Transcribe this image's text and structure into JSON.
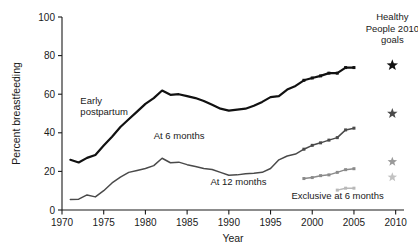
{
  "chart_data": {
    "type": "line",
    "title": "",
    "xlabel": "Year",
    "ylabel": "Percent breastfeeding",
    "xlim": [
      1970,
      2011
    ],
    "ylim": [
      0,
      100
    ],
    "xticks": [
      1970,
      1975,
      1980,
      1985,
      1990,
      1995,
      2000,
      2005,
      2010
    ],
    "yticks": [
      0,
      20,
      40,
      60,
      80,
      100
    ],
    "grid": false,
    "legend": "inline-annotations",
    "series": [
      {
        "name": "Early postpartum",
        "color": "#111111",
        "width": 2.2,
        "label_text": "Early\npostpartum",
        "label_x": 1972.2,
        "label_y": 55,
        "markers_from": 1999,
        "x": [
          1971,
          1972,
          1973,
          1974,
          1975,
          1976,
          1977,
          1978,
          1979,
          1980,
          1981,
          1982,
          1983,
          1984,
          1985,
          1986,
          1987,
          1988,
          1989,
          1990,
          1991,
          1992,
          1993,
          1994,
          1995,
          1996,
          1997,
          1998,
          1999,
          2000,
          2001,
          2002,
          2003,
          2004,
          2005
        ],
        "y": [
          26.0,
          24.6,
          27.0,
          28.5,
          33.4,
          38.0,
          43.0,
          47.0,
          51.0,
          55.0,
          58.0,
          61.9,
          59.7,
          60.0,
          59.0,
          58.0,
          56.5,
          54.5,
          52.5,
          51.5,
          52.0,
          52.5,
          54.0,
          56.0,
          58.5,
          59.0,
          62.4,
          64.3,
          67.2,
          68.4,
          69.5,
          70.9,
          70.9,
          73.8,
          73.8
        ]
      },
      {
        "name": "At 6 months",
        "color": "#4a4a4a",
        "width": 1.5,
        "label_text": "At 6 months",
        "label_x": 1981.0,
        "label_y": 37,
        "markers_from": 1999,
        "x": [
          1971,
          1972,
          1973,
          1974,
          1975,
          1976,
          1977,
          1978,
          1979,
          1980,
          1981,
          1982,
          1983,
          1984,
          1985,
          1986,
          1987,
          1988,
          1989,
          1990,
          1991,
          1992,
          1993,
          1994,
          1995,
          1996,
          1997,
          1998,
          1999,
          2000,
          2001,
          2002,
          2003,
          2004,
          2005
        ],
        "y": [
          5.5,
          5.6,
          7.8,
          6.8,
          10.0,
          14.0,
          17.0,
          19.5,
          20.5,
          21.5,
          23.0,
          26.8,
          24.5,
          24.8,
          23.5,
          22.5,
          21.5,
          21.0,
          19.5,
          18.0,
          18.2,
          18.8,
          19.0,
          19.5,
          21.5,
          26.0,
          28.0,
          29.0,
          31.5,
          33.5,
          34.8,
          36.2,
          37.5,
          41.5,
          42.4
        ]
      },
      {
        "name": "At 12 months",
        "color": "#8a8a8a",
        "width": 1.5,
        "label_text": "At 12 months",
        "label_x": 1987.8,
        "label_y": 13,
        "markers_from": 1999,
        "x": [
          1999,
          2000,
          2001,
          2002,
          2003,
          2004,
          2005
        ],
        "y": [
          16.3,
          16.8,
          17.8,
          18.2,
          19.5,
          20.9,
          21.4
        ]
      },
      {
        "name": "Exclusive at 6 months",
        "color": "#b8b8b8",
        "width": 1.5,
        "label_text": "Exclusive at 6 months",
        "label_x": 1997.5,
        "label_y": 5.5,
        "markers_from": 2003,
        "x": [
          2003,
          2004,
          2005
        ],
        "y": [
          10.3,
          11.3,
          11.3
        ]
      }
    ],
    "goals": {
      "label": "Healthy\nPeople 2010\ngoals",
      "label_lines": [
        "Healthy",
        "People 2010",
        "goals"
      ],
      "x": 2009.6,
      "points": [
        {
          "name": "Early postpartum goal",
          "value": 75,
          "color": "#111111",
          "size": 12
        },
        {
          "name": "At 6 months goal",
          "value": 50,
          "color": "#4a4a4a",
          "size": 11
        },
        {
          "name": "At 12 months goal",
          "value": 25,
          "color": "#9a9a9a",
          "size": 10
        },
        {
          "name": "Exclusive at 6 months goal",
          "value": 17,
          "color": "#c2c2c2",
          "size": 10
        }
      ]
    }
  }
}
